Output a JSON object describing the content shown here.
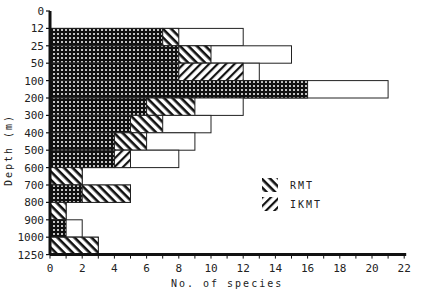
{
  "chart_data": {
    "type": "bar",
    "orientation": "horizontal",
    "stacked": true,
    "title": "",
    "xlabel": "No. of species",
    "ylabel": "Depth (m)",
    "xlim": [
      0,
      22
    ],
    "xticks": [
      0,
      2,
      4,
      6,
      8,
      10,
      12,
      14,
      16,
      18,
      20,
      22
    ],
    "yticks": [
      "0",
      "12",
      "25",
      "50",
      "100",
      "200",
      "300",
      "400",
      "500",
      "600",
      "700",
      "800",
      "900",
      "1000",
      "1250"
    ],
    "grid": false,
    "legend": {
      "position": "inside-right",
      "entries": [
        {
          "name": "RMT",
          "pattern": "backslash-hatch"
        },
        {
          "name": "IKMT",
          "pattern": "slash-hatch"
        }
      ]
    },
    "categories": [
      "12-25",
      "25-50",
      "50-100",
      "100-200",
      "200-300",
      "300-400",
      "400-500",
      "500-600",
      "600-700",
      "700-800",
      "800-900",
      "900-1000",
      "1000-1250"
    ],
    "series": [
      {
        "name": "Both nets (crosshatch)",
        "pattern": "crosshatch",
        "values": [
          7,
          8,
          8,
          16,
          6,
          5,
          4,
          4,
          0,
          2,
          0,
          1,
          0
        ]
      },
      {
        "name": "RMT",
        "pattern": "backslash-hatch",
        "values": [
          1,
          2,
          0,
          0,
          3,
          2,
          2,
          0,
          2,
          3,
          1,
          0,
          3
        ]
      },
      {
        "name": "IKMT",
        "pattern": "slash-hatch",
        "values": [
          0,
          0,
          4,
          0,
          0,
          0,
          0,
          1,
          0,
          0,
          0,
          0,
          0
        ]
      },
      {
        "name": "Total (open)",
        "pattern": "open",
        "values": [
          12,
          15,
          13,
          21,
          12,
          10,
          9,
          8,
          2,
          5,
          1,
          2,
          3
        ]
      }
    ]
  }
}
